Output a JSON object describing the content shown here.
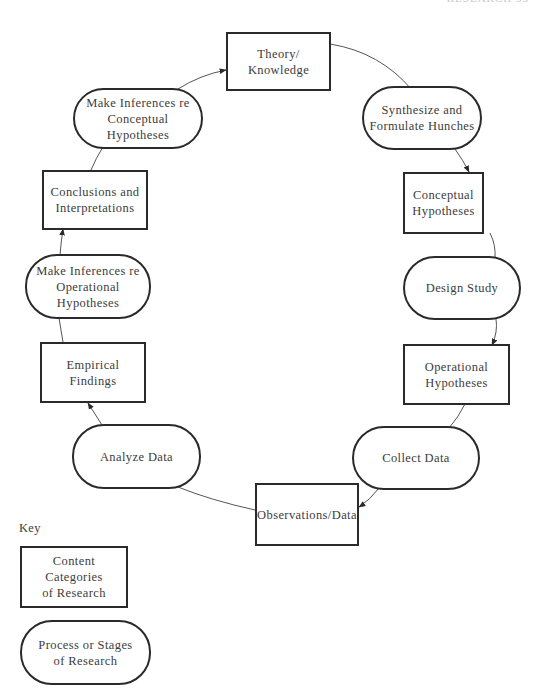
{
  "header": {
    "fragment": "RESEARCH   33"
  },
  "diagram": {
    "nodes": [
      {
        "id": "theory_knowledge",
        "type": "content",
        "label": "Theory/\nKnowledge"
      },
      {
        "id": "synthesize",
        "type": "process",
        "label": "Synthesize and\nFormulate Hunches"
      },
      {
        "id": "conceptual_hypotheses",
        "type": "content",
        "label": "Conceptual\nHypotheses"
      },
      {
        "id": "design_study",
        "type": "process",
        "label": "Design Study"
      },
      {
        "id": "operational_hypotheses",
        "type": "content",
        "label": "Operational\nHypotheses"
      },
      {
        "id": "collect_data",
        "type": "process",
        "label": "Collect Data"
      },
      {
        "id": "observations_data",
        "type": "content",
        "label": "Observations/Data"
      },
      {
        "id": "analyze_data",
        "type": "process",
        "label": "Analyze Data"
      },
      {
        "id": "empirical_findings",
        "type": "content",
        "label": "Empirical\nFindings"
      },
      {
        "id": "inferences_operational",
        "type": "process",
        "label": "Make Inferences re\nOperational Hypotheses"
      },
      {
        "id": "conclusions",
        "type": "content",
        "label": "Conclusions and\nInterpretations"
      },
      {
        "id": "inferences_conceptual",
        "type": "process",
        "label": "Make Inferences re\nConceptual Hypotheses"
      }
    ],
    "edges": [
      {
        "from": "theory_knowledge",
        "to": "synthesize"
      },
      {
        "from": "synthesize",
        "to": "conceptual_hypotheses"
      },
      {
        "from": "conceptual_hypotheses",
        "to": "design_study"
      },
      {
        "from": "design_study",
        "to": "operational_hypotheses"
      },
      {
        "from": "operational_hypotheses",
        "to": "collect_data"
      },
      {
        "from": "collect_data",
        "to": "observations_data"
      },
      {
        "from": "observations_data",
        "to": "analyze_data"
      },
      {
        "from": "analyze_data",
        "to": "empirical_findings"
      },
      {
        "from": "empirical_findings",
        "to": "inferences_operational"
      },
      {
        "from": "inferences_operational",
        "to": "conclusions"
      },
      {
        "from": "conclusions",
        "to": "inferences_conceptual"
      },
      {
        "from": "inferences_conceptual",
        "to": "theory_knowledge"
      }
    ]
  },
  "key": {
    "title": "Key",
    "items": [
      {
        "shape": "rectangle",
        "label": "Content Categories\nof Research"
      },
      {
        "shape": "rounded",
        "label": "Process or Stages\nof Research"
      }
    ]
  },
  "colors": {
    "stroke": "#2a2a2a",
    "text": "#3c3c3c",
    "background": "#ffffff"
  }
}
